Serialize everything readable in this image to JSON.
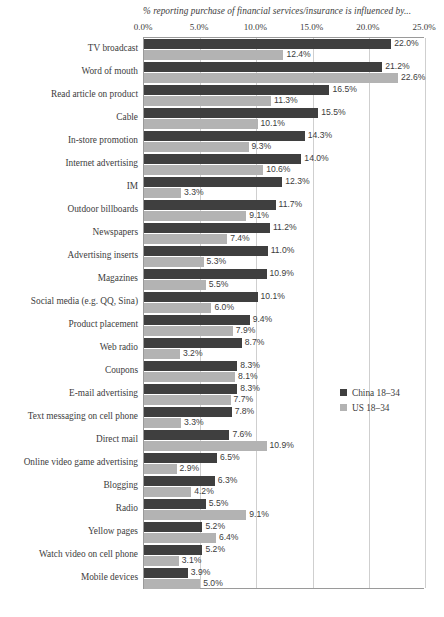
{
  "chart_data": {
    "type": "bar",
    "orientation": "horizontal",
    "title": "% reporting purchase of financial services/insurance is influenced by...",
    "xlabel": "",
    "ylabel": "",
    "xlim": [
      0,
      25
    ],
    "grid": true,
    "legend_position": "right-middle",
    "tick_labels": [
      "0.0%",
      "5.0%",
      "10.0%",
      "15.0%",
      "20.0%",
      "25.0%"
    ],
    "tick_values": [
      0,
      5,
      10,
      15,
      20,
      25
    ],
    "categories": [
      "TV broadcast",
      "Word of mouth",
      "Read article on product",
      "Cable",
      "In-store promotion",
      "Internet advertising",
      "IM",
      "Outdoor billboards",
      "Newspapers",
      "Advertising inserts",
      "Magazines",
      "Social media (e.g. QQ, Sina)",
      "Product placement",
      "Web radio",
      "Coupons",
      "E-mail advertising",
      "Text messaging on cell phone",
      "Direct mail",
      "Online video game advertising",
      "Blogging",
      "Radio",
      "Yellow pages",
      "Watch video on cell phone",
      "Mobile devices"
    ],
    "series": [
      {
        "name": "China 18–34",
        "color": "#3f3f3f",
        "values": [
          22.0,
          21.2,
          16.5,
          15.5,
          14.3,
          14.0,
          12.3,
          11.7,
          11.2,
          11.0,
          10.9,
          10.1,
          9.4,
          8.7,
          8.3,
          8.3,
          7.8,
          7.6,
          6.5,
          6.3,
          5.5,
          5.2,
          5.2,
          3.9
        ],
        "labels": [
          "22.0%",
          "21.2%",
          "16.5%",
          "15.5%",
          "14.3%",
          "14.0%",
          "12.3%",
          "11.7%",
          "11.2%",
          "11.0%",
          "10.9%",
          "10.1%",
          "9.4%",
          "8.7%",
          "8.3%",
          "8.3%",
          "7.8%",
          "7.6%",
          "6.5%",
          "6.3%",
          "5.5%",
          "5.2%",
          "5.2%",
          "3.9%"
        ]
      },
      {
        "name": "US 18–34",
        "color": "#b3b3b3",
        "values": [
          12.4,
          22.6,
          11.3,
          10.1,
          9.3,
          10.6,
          3.3,
          9.1,
          7.4,
          5.3,
          5.5,
          6.0,
          7.9,
          3.2,
          8.1,
          7.7,
          3.3,
          10.9,
          2.9,
          4.2,
          9.1,
          6.4,
          3.1,
          5.0
        ],
        "labels": [
          "12.4%",
          "22.6%",
          "11.3%",
          "10.1%",
          "9.3%",
          "10.6%",
          "3.3%",
          "9.1%",
          "7.4%",
          "5.3%",
          "5.5%",
          "6.0%",
          "7.9%",
          "3.2%",
          "8.1%",
          "7.7%",
          "3.3%",
          "10.9%",
          "2.9%",
          "4.2%",
          "9.1%",
          "6.4%",
          "3.1%",
          "5.0%"
        ]
      }
    ]
  }
}
